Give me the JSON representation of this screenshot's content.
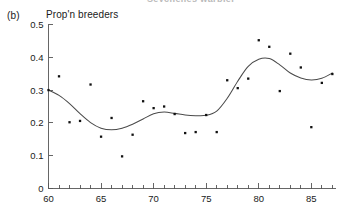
{
  "figure": {
    "panel_label": "(b)",
    "cut_title": "Seychelles warbler",
    "axis_color": "#555555",
    "point_color": "#111111",
    "curve_color": "#4a4a4a"
  },
  "chart_data": {
    "type": "scatter",
    "title": "",
    "subtitle": "",
    "xlabel": "",
    "ylabel": "Prop'n breeders",
    "xlim": [
      60,
      87.3
    ],
    "ylim": [
      0,
      0.5
    ],
    "grid": false,
    "legend": null,
    "x_ticks_major": [
      60,
      65,
      70,
      75,
      80,
      85
    ],
    "x_tick_labels": [
      "60",
      "65",
      "70",
      "75",
      "80",
      "85"
    ],
    "x_minor_step": 1,
    "y_ticks": [
      0,
      0.1,
      0.2,
      0.3,
      0.4,
      0.5
    ],
    "y_tick_labels": [
      "0",
      "0.1",
      "0.2",
      "0.3",
      "0.4",
      "0.5"
    ],
    "x": [
      60,
      61,
      62,
      63,
      64,
      65,
      66,
      67,
      68,
      69,
      70,
      71,
      72,
      73,
      74,
      75,
      76,
      77,
      78,
      79,
      80,
      81,
      82,
      83,
      84,
      85,
      86,
      87
    ],
    "y": [
      0.3,
      0.342,
      0.202,
      0.206,
      0.317,
      0.158,
      0.215,
      0.098,
      0.164,
      0.266,
      0.245,
      0.25,
      0.227,
      0.169,
      0.172,
      0.224,
      0.172,
      0.33,
      0.306,
      0.335,
      0.452,
      0.432,
      0.297,
      0.411,
      0.369,
      0.187,
      0.322,
      0.349
    ],
    "series": [
      {
        "name": "Prop'n breeders",
        "type": "scatter",
        "values": [
          0.3,
          0.342,
          0.202,
          0.206,
          0.317,
          0.158,
          0.215,
          0.098,
          0.164,
          0.266,
          0.245,
          0.25,
          0.227,
          0.169,
          0.172,
          0.224,
          0.172,
          0.33,
          0.306,
          0.335,
          0.452,
          0.432,
          0.297,
          0.411,
          0.369,
          0.187,
          0.322,
          0.349
        ]
      },
      {
        "name": "smoothed fit",
        "type": "line",
        "x": [
          60,
          61,
          62,
          63,
          64,
          65,
          66,
          67,
          68,
          69,
          70,
          71,
          72,
          73,
          74,
          75,
          76,
          77,
          78,
          79,
          80,
          81,
          82,
          83,
          84,
          85,
          86,
          87
        ],
        "values": [
          0.3,
          0.284,
          0.259,
          0.228,
          0.201,
          0.184,
          0.179,
          0.184,
          0.196,
          0.212,
          0.228,
          0.233,
          0.229,
          0.224,
          0.222,
          0.223,
          0.236,
          0.275,
          0.327,
          0.372,
          0.394,
          0.396,
          0.377,
          0.352,
          0.337,
          0.331,
          0.336,
          0.352
        ]
      }
    ]
  }
}
